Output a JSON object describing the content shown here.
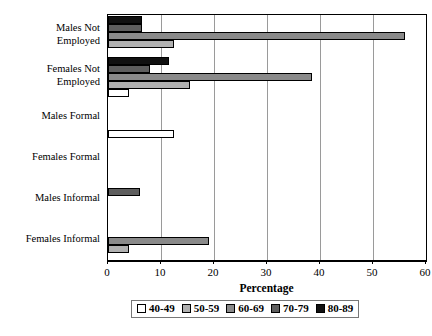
{
  "chart_data": {
    "type": "bar",
    "orientation": "horizontal",
    "title": "",
    "xlabel": "Percentage",
    "ylabel": "",
    "xlim": [
      0,
      60
    ],
    "xticks": [
      0,
      10,
      20,
      30,
      40,
      50,
      60
    ],
    "xtick_labels": [
      "0",
      "10",
      "20",
      "30",
      "40",
      "50",
      "60"
    ],
    "grid": true,
    "grid_axis": "x",
    "legend_position": "bottom",
    "categories": [
      "Males Not Employed",
      "Females Not Employed",
      "Males Formal",
      "Females Formal",
      "Males Informal",
      "Females Informal"
    ],
    "category_lines": [
      [
        "Males Not",
        "Employed"
      ],
      [
        "Females Not",
        "Employed"
      ],
      [
        "Males Formal"
      ],
      [
        "Females Formal"
      ],
      [
        "Males Informal"
      ],
      [
        "Females Informal"
      ]
    ],
    "series": [
      {
        "name": "40-49",
        "color": "#ffffff",
        "values": [
          0,
          4,
          12.5,
          0,
          0,
          0
        ]
      },
      {
        "name": "50-59",
        "color": "#b0b0b0",
        "values": [
          12.5,
          15.5,
          0,
          0,
          0,
          4
        ]
      },
      {
        "name": "60-69",
        "color": "#8a8a8a",
        "values": [
          56,
          38.5,
          0,
          0,
          0,
          19
        ]
      },
      {
        "name": "70-79",
        "color": "#5e5e5e",
        "values": [
          6.5,
          8,
          0,
          0,
          6,
          0
        ]
      },
      {
        "name": "80-89",
        "color": "#111111",
        "values": [
          6.5,
          11.5,
          0,
          0,
          0,
          0
        ]
      }
    ]
  },
  "legend": {
    "items": [
      {
        "label": "40-49",
        "color": "#ffffff"
      },
      {
        "label": "50-59",
        "color": "#b0b0b0"
      },
      {
        "label": "60-69",
        "color": "#8a8a8a"
      },
      {
        "label": "70-79",
        "color": "#5e5e5e"
      },
      {
        "label": "80-89",
        "color": "#111111"
      }
    ]
  },
  "axis": {
    "x_title": "Percentage"
  }
}
